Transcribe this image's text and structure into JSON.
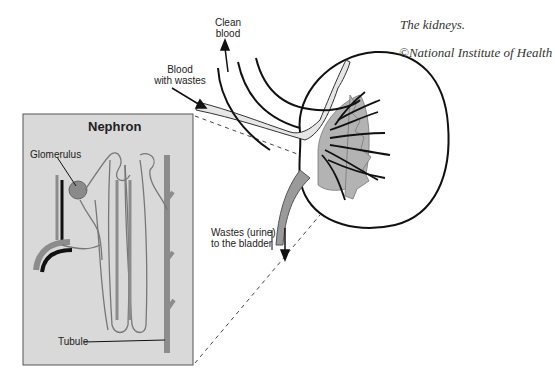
{
  "figure": {
    "caption": "The kidneys.",
    "credit": "©National Institute of Health"
  },
  "labels": {
    "clean_blood": [
      "Clean",
      "blood"
    ],
    "blood_with_wastes": [
      "Blood",
      "with wastes"
    ],
    "wastes_urine": [
      "Wastes (urine)",
      "to the bladder"
    ],
    "nephron_title": "Nephron",
    "glomerulus": "Glomerulus",
    "tubule": "Tubule"
  },
  "colors": {
    "nephron_bg": "#d9d9d9",
    "vessel_dark": "#111111",
    "renal_light": "#e6e6e6",
    "renal_mid": "#b3b3b3",
    "tubule_gray": "#8c8c8c",
    "glomerulus": "#8a8a8a"
  }
}
